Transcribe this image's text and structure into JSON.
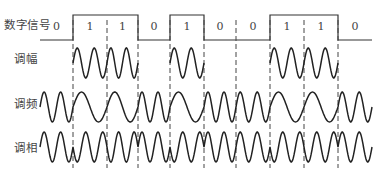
{
  "labels": {
    "digital": "数字信号",
    "am": "调幅",
    "fm": "调频",
    "pm": "调相"
  },
  "bits": [
    "0",
    "1",
    "1",
    "0",
    "1",
    "0",
    "0",
    "1",
    "1",
    "0"
  ],
  "boundaries_x": [
    40,
    73,
    107,
    138,
    170,
    204,
    236,
    270,
    304,
    338,
    372
  ],
  "colors": {
    "line": "#333333",
    "dash": "#444444"
  }
}
